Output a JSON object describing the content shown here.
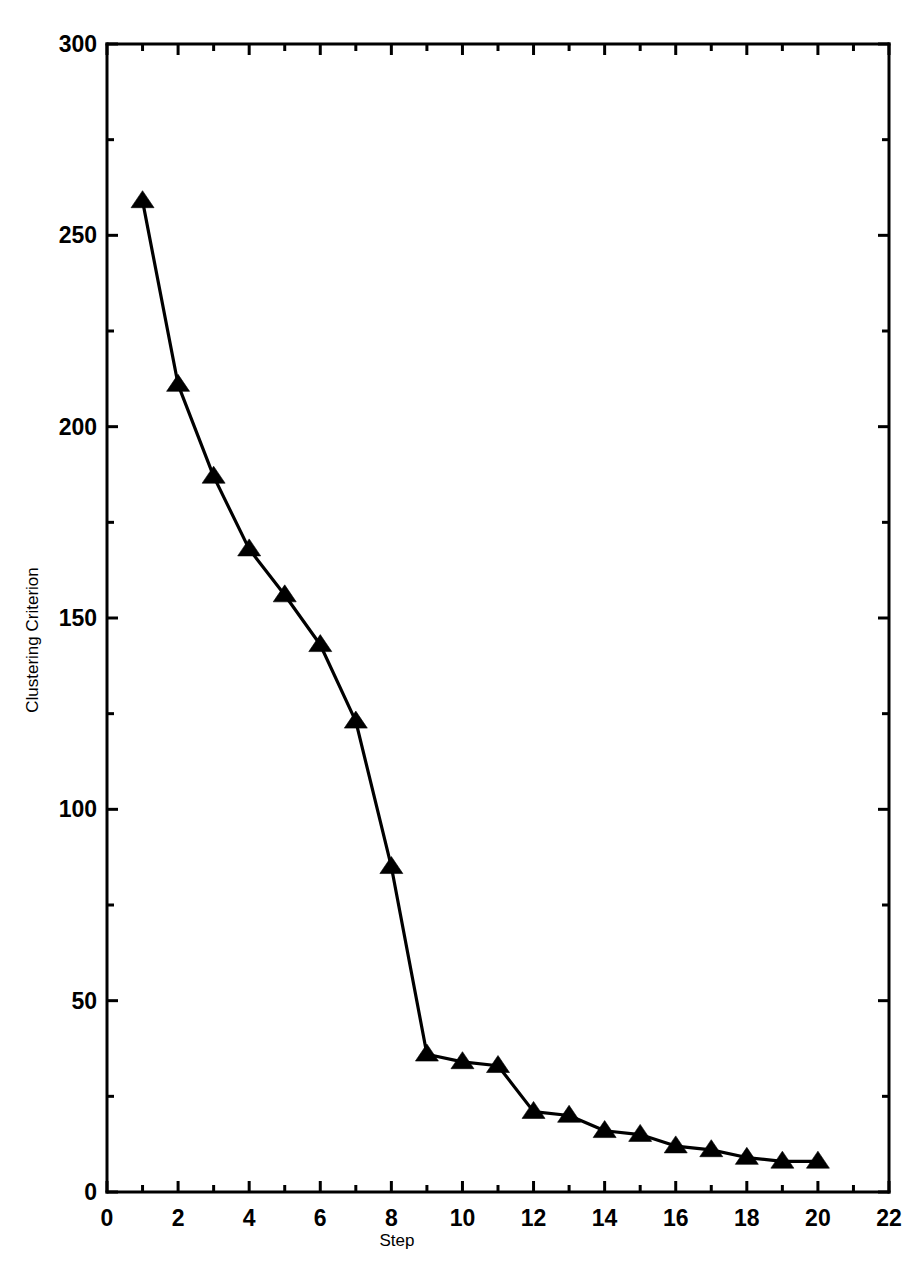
{
  "chart_data": {
    "type": "line",
    "title": "",
    "subtitle": "",
    "xlabel": "Step",
    "ylabel": "Clustering Criterion",
    "xlim": [
      0,
      22
    ],
    "ylim": [
      0,
      300
    ],
    "x_major_ticks": [
      0,
      2,
      4,
      6,
      8,
      10,
      12,
      14,
      16,
      18,
      20,
      22
    ],
    "x_minor_ticks": [
      1,
      3,
      5,
      7,
      9,
      11,
      13,
      15,
      17,
      19,
      21
    ],
    "x_tick_labels": [
      "0",
      "2",
      "4",
      "6",
      "8",
      "10",
      "12",
      "14",
      "16",
      "18",
      "20",
      "22"
    ],
    "y_major_ticks": [
      0,
      50,
      100,
      150,
      200,
      250,
      300
    ],
    "y_minor_ticks": [
      25,
      75,
      125,
      175,
      225,
      275
    ],
    "y_tick_labels": [
      "0",
      "50",
      "100",
      "150",
      "200",
      "250",
      "300"
    ],
    "grid": false,
    "legend": false,
    "legend_position": "none",
    "marker": "triangle-up",
    "line_color": "#000000",
    "marker_color": "#000000",
    "background_color": "#ffffff",
    "x": [
      1,
      2,
      3,
      4,
      5,
      6,
      7,
      8,
      9,
      10,
      11,
      12,
      13,
      14,
      15,
      16,
      17,
      18,
      19,
      20
    ],
    "values": [
      259,
      211,
      187,
      168,
      156,
      143,
      123,
      85,
      36,
      34,
      33,
      21,
      20,
      16,
      15,
      12,
      11,
      9,
      8,
      8
    ],
    "series": [
      {
        "name": "Clustering Criterion",
        "values": [
          259,
          211,
          187,
          168,
          156,
          143,
          123,
          85,
          36,
          34,
          33,
          21,
          20,
          16,
          15,
          12,
          11,
          9,
          8,
          8
        ]
      }
    ],
    "annotations": []
  }
}
